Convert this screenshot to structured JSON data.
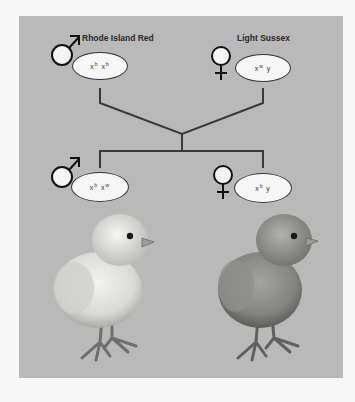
{
  "diagram": {
    "background_color": "#b9b9b9",
    "line_color": "#3a3a3a",
    "parents": [
      {
        "id": "father",
        "breed": "Rhode Island Red",
        "sex": "male",
        "sex_symbol": "♂",
        "genotype": {
          "chromosome_1": "x",
          "allele_1": "b",
          "chromosome_2": "x",
          "allele_2": "b"
        }
      },
      {
        "id": "mother",
        "breed": "Light Sussex",
        "sex": "female",
        "sex_symbol": "♀",
        "genotype": {
          "chromosome_1": "x",
          "allele_1": "w",
          "chromosome_2": "y",
          "allele_2": ""
        }
      }
    ],
    "offspring": [
      {
        "id": "male-chick",
        "sex": "male",
        "sex_symbol": "♂",
        "genotype": {
          "chromosome_1": "x",
          "allele_1": "b",
          "chromosome_2": "x",
          "allele_2": "w"
        },
        "image": "pale-yellow-chick-illustration"
      },
      {
        "id": "female-chick",
        "sex": "female",
        "sex_symbol": "♀",
        "genotype": {
          "chromosome_1": "x",
          "allele_1": "b",
          "chromosome_2": "y",
          "allele_2": ""
        },
        "image": "brown-chick-illustration"
      }
    ]
  }
}
